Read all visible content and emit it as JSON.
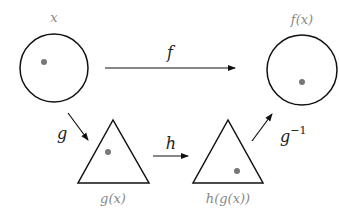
{
  "diagram": {
    "nodes": {
      "x": {
        "label": "x",
        "shape": "circle"
      },
      "fx": {
        "label": "f(x)",
        "shape": "circle"
      },
      "gx": {
        "label": "g(x)",
        "shape": "triangle"
      },
      "hgx": {
        "label": "h(g(x))",
        "shape": "triangle"
      }
    },
    "edges": {
      "f": {
        "label": "f",
        "from": "x",
        "to": "f(x)"
      },
      "g": {
        "label": "g",
        "from": "x",
        "to": "g(x)"
      },
      "h": {
        "label": "h",
        "from": "g(x)",
        "to": "h(g(x))"
      },
      "ginv": {
        "label": "g",
        "superscript": "−1",
        "from": "h(g(x))",
        "to": "f(x)"
      }
    },
    "colors": {
      "stroke": "#111111",
      "dot": "#777777",
      "node_label": "#888888",
      "edge_label": "#222222"
    }
  }
}
